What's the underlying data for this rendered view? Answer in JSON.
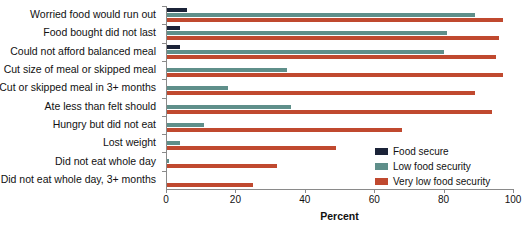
{
  "chart_data": {
    "type": "bar",
    "orientation": "horizontal",
    "title": "",
    "xlabel": "Percent",
    "ylabel": "",
    "xlim": [
      0,
      100
    ],
    "xticks": [
      0,
      20,
      40,
      60,
      80,
      100
    ],
    "grid": false,
    "legend_position": "inside-right",
    "categories": [
      "Worried food would run out",
      "Food bought did not last",
      "Could not afford balanced meal",
      "Cut size of meal or skipped meal",
      "Cut or skipped meal in 3+ months",
      "Ate less than felt should",
      "Hungry but did not eat",
      "Lost weight",
      "Did not eat whole day",
      "Did not eat whole day, 3+ months"
    ],
    "series": [
      {
        "name": "Food secure",
        "color": "#1b2338",
        "values": [
          6,
          4,
          4,
          0,
          0,
          0,
          0,
          0,
          0,
          0
        ]
      },
      {
        "name": "Low food security",
        "color": "#5f8f8a",
        "values": [
          89,
          81,
          80,
          35,
          18,
          36,
          11,
          4,
          1,
          0
        ]
      },
      {
        "name": "Very low food security",
        "color": "#c0492f",
        "values": [
          97,
          96,
          95,
          97,
          89,
          94,
          68,
          49,
          32,
          25
        ]
      }
    ]
  },
  "axis": {
    "x_title": "Percent",
    "tick_labels": [
      "0",
      "20",
      "40",
      "60",
      "80",
      "100"
    ]
  },
  "legend": {
    "items": [
      {
        "label": "Food secure",
        "color": "#1b2338"
      },
      {
        "label": "Low food security",
        "color": "#5f8f8a"
      },
      {
        "label": "Very low food security",
        "color": "#c0492f"
      }
    ]
  }
}
